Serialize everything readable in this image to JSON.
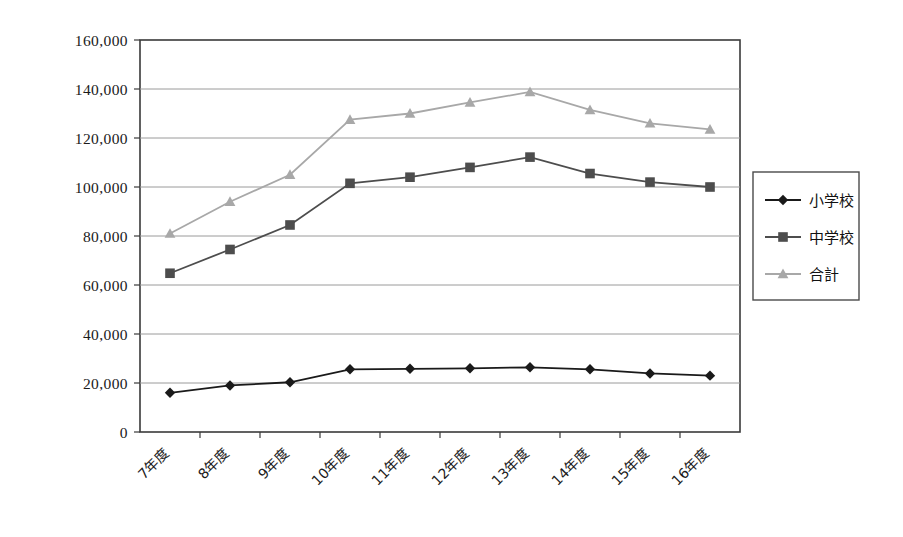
{
  "chart_data": {
    "type": "line",
    "title": "",
    "xlabel": "",
    "ylabel": "",
    "categories": [
      "7年度",
      "8年度",
      "9年度",
      "10年度",
      "11年度",
      "12年度",
      "13年度",
      "14年度",
      "15年度",
      "16年度"
    ],
    "series": [
      {
        "name": "小学校",
        "marker": "diamond",
        "color": "#1a1a1a",
        "values": [
          16000,
          19000,
          20300,
          25600,
          25800,
          26000,
          26400,
          25600,
          23900,
          23000
        ]
      },
      {
        "name": "中学校",
        "marker": "square",
        "color": "#4d4d4d",
        "values": [
          64800,
          74500,
          84500,
          101500,
          104000,
          108000,
          112200,
          105500,
          102000,
          100000
        ]
      },
      {
        "name": "合計",
        "marker": "triangle",
        "color": "#a8a8a8",
        "values": [
          81000,
          94000,
          105000,
          127500,
          130000,
          134500,
          138800,
          131500,
          126000,
          123500
        ]
      }
    ],
    "ylim": [
      0,
      160000
    ],
    "yticks": [
      0,
      20000,
      40000,
      60000,
      80000,
      100000,
      120000,
      140000,
      160000
    ],
    "ytick_labels": [
      "0",
      "20,000",
      "40,000",
      "60,000",
      "80,000",
      "100,000",
      "120,000",
      "140,000",
      "160,000"
    ],
    "grid": true,
    "legend_position": "right",
    "xtick_label_rotation": -45
  },
  "legend": {
    "entries": [
      {
        "label": "小学校",
        "marker": "diamond-icon",
        "color": "#1a1a1a"
      },
      {
        "label": "中学校",
        "marker": "square-icon",
        "color": "#4d4d4d"
      },
      {
        "label": "合計",
        "marker": "triangle-icon",
        "color": "#a8a8a8"
      }
    ]
  },
  "colors": {
    "elementary": "#1a1a1a",
    "junior_high": "#4d4d4d",
    "total": "#a8a8a8",
    "gridline": "#9a9a9a",
    "frame": "#3a3a3a",
    "background": "#ffffff"
  }
}
